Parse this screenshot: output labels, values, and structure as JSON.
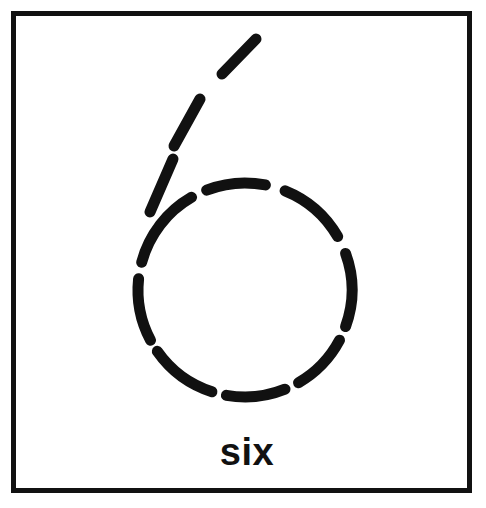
{
  "figure": {
    "title": "six",
    "caption": "six",
    "background_color": "#ffffff",
    "ink_color": "#111111",
    "frame": {
      "name": "card-border",
      "x": 11,
      "y": 11,
      "width": 461,
      "height": 482,
      "stroke_width": 5,
      "color": "#111111"
    },
    "caption_position": {
      "x": 247,
      "y": 465,
      "font_size": 38,
      "font_weight": "bold"
    },
    "drawing": {
      "name": "dashed-circle-with-tail",
      "description": "hand-drawn dashed outline of the numeral six: a dashed circle body with three dashes forming the upward stroke",
      "circle": {
        "center_x": 245,
        "center_y": 290,
        "radius": 107,
        "stroke_width": 11,
        "dash_count": 8
      },
      "circle_dashes": [
        {
          "id": "arc-upper-left",
          "start_angle": 195,
          "end_angle": 240
        },
        {
          "id": "arc-top-left",
          "start_angle": 249,
          "end_angle": 281
        },
        {
          "id": "arc-top-right",
          "start_angle": 292,
          "end_angle": 330
        },
        {
          "id": "arc-right-upper",
          "start_angle": 340,
          "end_angle": 20
        },
        {
          "id": "arc-right-lower",
          "start_angle": 60,
          "end_angle": 28
        },
        {
          "id": "arc-bottom-right",
          "start_angle": 68,
          "end_angle": 100
        },
        {
          "id": "arc-bottom-left",
          "start_angle": 108,
          "end_angle": 145
        },
        {
          "id": "arc-left-lower",
          "start_angle": 152,
          "end_angle": 186
        }
      ],
      "tail_dashes": [
        {
          "id": "tail-dash-bottom",
          "x1": 150,
          "y1": 212,
          "x2": 173,
          "y2": 159
        },
        {
          "id": "tail-dash-middle",
          "x1": 174,
          "y1": 146,
          "x2": 200,
          "y2": 99
        },
        {
          "id": "tail-dash-top",
          "x1": 222,
          "y1": 74,
          "x2": 256,
          "y2": 39
        }
      ]
    }
  }
}
